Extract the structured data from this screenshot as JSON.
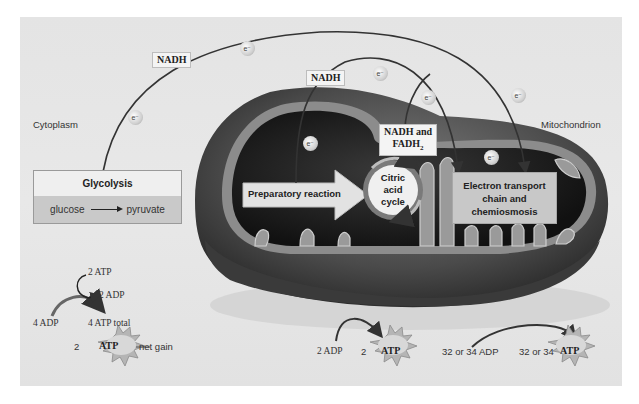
{
  "diagram": {
    "regions": {
      "cytoplasm": "Cytoplasm",
      "mitochondrion": "Mitochondrion"
    },
    "carriers": {
      "nadh_glycolysis": "NADH",
      "nadh_prep": "NADH",
      "nadh_fadh2_line1": "NADH and",
      "nadh_fadh2_line2": "FADH",
      "nadh_fadh2_sub": "2"
    },
    "electron_label": "e⁻",
    "stages": {
      "glycolysis": {
        "title": "Glycolysis",
        "input": "glucose",
        "output": "pyruvate"
      },
      "preparatory": "Preparatory reaction",
      "citric_acid": {
        "line1": "Citric acid",
        "line2": "cycle"
      },
      "etc": {
        "line1": "Electron transport",
        "line2": "chain and",
        "line3": "chemiosmosis"
      }
    },
    "atp_yields": {
      "glycolysis": {
        "invest_atp": "2 ATP",
        "invest_adp": "2 ADP",
        "input_adp": "4 ADP",
        "total": "4 ATP total",
        "net_count": "2",
        "atp_label": "ATP",
        "net_gain": "net gain"
      },
      "citric_acid": {
        "input_adp": "2 ADP",
        "count": "2",
        "atp_label": "ATP"
      },
      "etc": {
        "input_adp": "32 or 34 ADP",
        "count": "32 or 34",
        "atp_label": "ATP"
      }
    },
    "colors": {
      "panel": "#e6e6e6",
      "mito_outer": "#5a5a5a",
      "mito_matrix": "#1c1c1c",
      "label_box": "#c8c8c8",
      "atp_burst": "#b5b5b5"
    }
  }
}
